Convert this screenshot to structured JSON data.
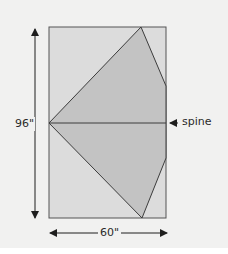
{
  "diagram": {
    "labels": {
      "height": "96\"",
      "width": "60\"",
      "spine": "spine"
    },
    "colors": {
      "background": "#f1f1f0",
      "rectangle_fill": "#dcdcdc",
      "shape_fill": "#c3c3c3",
      "stroke": "#3c3c3c"
    }
  }
}
